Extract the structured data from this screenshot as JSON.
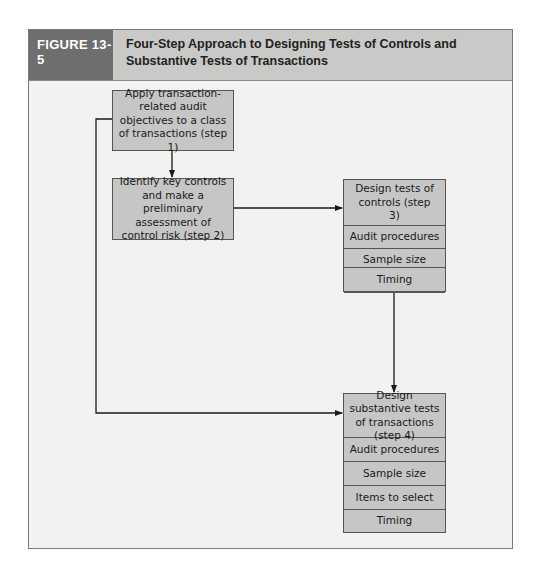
{
  "figure": {
    "label": "FIGURE 13-5",
    "title": "Four-Step Approach to Designing Tests of Controls and Substantive Tests of Transactions"
  },
  "steps": {
    "step1": {
      "text": "Apply transaction-related audit objectives to a class of transactions (step 1)"
    },
    "step2": {
      "text": "Identify key controls and make a preliminary assessment of control risk (step 2)"
    },
    "step3": {
      "header": "Design tests of controls (step 3)",
      "rows": [
        "Audit procedures",
        "Sample size",
        "Items to select",
        "Timing"
      ]
    },
    "step4": {
      "header": "Design substantive tests of transactions (step 4)",
      "rows": [
        "Audit procedures",
        "Sample size",
        "Items to select",
        "Timing"
      ]
    }
  },
  "connections": [
    {
      "from": "step1",
      "to": "step2"
    },
    {
      "from": "step2",
      "to": "step3"
    },
    {
      "from": "step3",
      "to": "step4"
    },
    {
      "from": "step1",
      "to": "step4"
    }
  ],
  "colors": {
    "label_bg": "#6e6e6e",
    "header_bg": "#c9c9c7",
    "panel_bg": "#f2f2f0",
    "box_fill": "#c6c6c6",
    "line": "#1a1a1a"
  }
}
